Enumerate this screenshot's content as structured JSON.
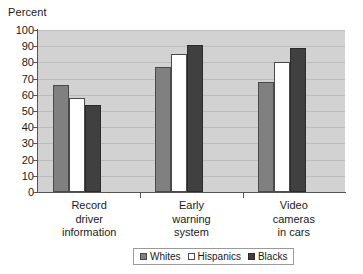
{
  "chart_data": {
    "type": "bar",
    "title": "",
    "xlabel": "",
    "ylabel": "Percent",
    "ylim": [
      0,
      100
    ],
    "ytick_step": 10,
    "yticks": [
      100,
      90,
      80,
      70,
      60,
      50,
      40,
      30,
      20,
      10,
      0
    ],
    "grid": true,
    "legend_position": "bottom",
    "categories": [
      "Record\ndriver\ninformation",
      "Early\nwarning\nsystem",
      "Video\ncameras\nin cars"
    ],
    "series": [
      {
        "name": "Whites",
        "color": "#808080",
        "values": [
          66,
          77,
          68
        ]
      },
      {
        "name": "Hispanics",
        "color": "#FFFFFF",
        "values": [
          58,
          85,
          80
        ]
      },
      {
        "name": "Blacks",
        "color": "#404040",
        "values": [
          54,
          91,
          89
        ]
      }
    ]
  },
  "colors": {
    "plot_background": "#D2D2D2",
    "gridline": "#BCBCBC",
    "axis": "#555555",
    "text": "#1A1A1A",
    "legend_border": "#9A9A9A"
  }
}
